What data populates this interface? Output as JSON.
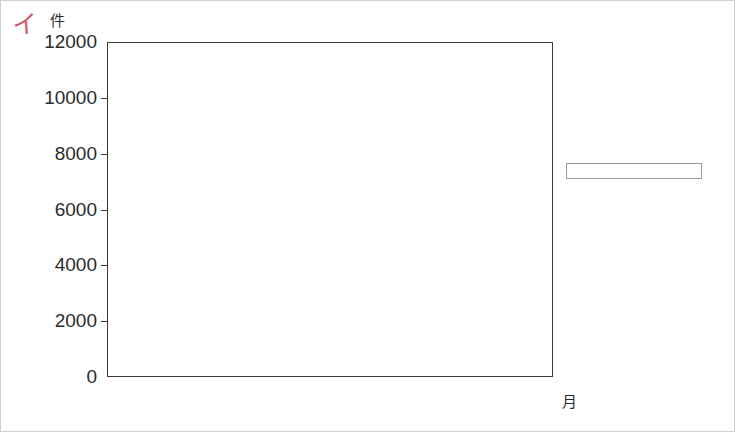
{
  "marker": {
    "label": "イ"
  },
  "axis": {
    "y_unit": "件",
    "x_unit": "月",
    "y_ticks": [
      "12000",
      "10000",
      "8000",
      "6000",
      "4000",
      "2000",
      "0"
    ],
    "x_ticks": [
      "1",
      "2",
      "3",
      "4",
      "5",
      "6",
      "7",
      "8",
      "9",
      "10",
      "11",
      "12"
    ]
  },
  "legend": {
    "items": [
      {
        "label": "50代以上",
        "color": "#9d9d94",
        "key": "senior"
      },
      {
        "label": "30代～50代",
        "color": "#ffffff",
        "key": "middle"
      },
      {
        "label": "20代以下",
        "color": "#de4a5a",
        "key": "young"
      }
    ]
  },
  "chart_data": {
    "type": "bar",
    "stacked": true,
    "title": "",
    "xlabel": "月",
    "ylabel": "件",
    "ylim": [
      0,
      12000
    ],
    "ytick_interval": 2000,
    "grid": false,
    "legend_position": "right",
    "categories": [
      "1",
      "2",
      "3",
      "4",
      "5",
      "6",
      "7",
      "8",
      "9",
      "10",
      "11",
      "12"
    ],
    "series": [
      {
        "name": "20代以下",
        "color": "#de4a5a",
        "values": [
          4350,
          2000,
          1300,
          2100,
          2000,
          2800,
          2200,
          2400,
          2400,
          2500,
          2500,
          4000
        ]
      },
      {
        "name": "30代～50代",
        "color": "#ffffff",
        "values": [
          4250,
          4000,
          3800,
          2800,
          5000,
          4150,
          2850,
          3000,
          2450,
          2200,
          4750,
          1600
        ]
      },
      {
        "name": "50代以上",
        "color": "#9d9d94",
        "values": [
          2300,
          1500,
          500,
          1200,
          1700,
          850,
          1000,
          1100,
          1200,
          1250,
          2050,
          3300
        ]
      }
    ],
    "cumulative_tops": {
      "young": [
        4350,
        2000,
        1300,
        2100,
        2000,
        2800,
        2200,
        2400,
        2400,
        2500,
        2500,
        4000
      ],
      "middle": [
        8600,
        6000,
        5100,
        4900,
        7000,
        6950,
        5050,
        5400,
        4850,
        4700,
        7250,
        5600
      ],
      "total": [
        10900,
        7500,
        5600,
        6100,
        8700,
        7800,
        6050,
        6500,
        6050,
        5950,
        9300,
        8900
      ]
    }
  }
}
